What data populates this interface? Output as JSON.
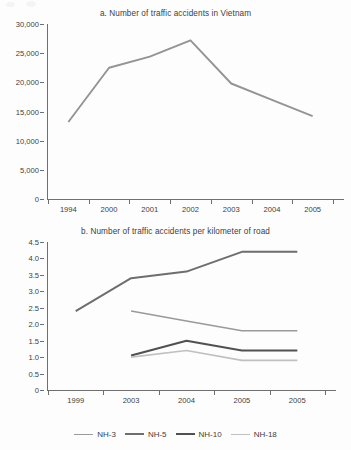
{
  "figure": {
    "background_color": "#fdfdfd",
    "axis_color": "#6f6f6f",
    "text_color": "#3d3d3d"
  },
  "chart_data": [
    {
      "type": "line",
      "panel": "a",
      "title": "a. Number of traffic accidents in Vietnam",
      "xlabel": "",
      "ylabel": "",
      "categories": [
        "1994",
        "2000",
        "2001",
        "2002",
        "2003",
        "2004",
        "2005"
      ],
      "ytick_labels": [
        "0",
        "5,000",
        "10,000",
        "15,000",
        "20,000",
        "25,000",
        "30,000"
      ],
      "ytick_values": [
        0,
        5000,
        10000,
        15000,
        20000,
        25000,
        30000
      ],
      "ylim": [
        0,
        30000
      ],
      "grid": false,
      "legend": "none",
      "series": [
        {
          "name": "Number of traffic accidents",
          "color": "#949494",
          "width": 1.9,
          "values": [
            13200,
            22500,
            24400,
            27200,
            19800,
            17000,
            14200
          ]
        }
      ]
    },
    {
      "type": "line",
      "panel": "b",
      "title": "b. Number of traffic accidents per kilometer of road",
      "xlabel": "",
      "ylabel": "",
      "categories": [
        "1999",
        "2003",
        "2004",
        "2005",
        "2005"
      ],
      "ytick_labels": [
        "0",
        "0.5",
        "1.0",
        "1.5",
        "2.0",
        "2.5",
        "3.0",
        "3.5",
        "4.0",
        "4.5"
      ],
      "ytick_values": [
        0,
        0.5,
        1.0,
        1.5,
        2.0,
        2.5,
        3.0,
        3.5,
        4.0,
        4.5
      ],
      "ylim": [
        0,
        4.5
      ],
      "grid": false,
      "legend": "bottom",
      "series": [
        {
          "name": "NH-3",
          "color": "#9a9a9a",
          "width": 1.6,
          "values": [
            null,
            2.4,
            2.1,
            1.8,
            1.8
          ]
        },
        {
          "name": "NH-5",
          "color": "#6e6e6e",
          "width": 2.0,
          "values": [
            2.4,
            3.4,
            3.6,
            4.2,
            4.2
          ]
        },
        {
          "name": "NH-10",
          "color": "#515151",
          "width": 2.0,
          "values": [
            null,
            1.05,
            1.5,
            1.2,
            1.2
          ]
        },
        {
          "name": "NH-18",
          "color": "#c0c0c0",
          "width": 1.6,
          "values": [
            null,
            1.0,
            1.2,
            0.9,
            0.9
          ]
        }
      ]
    }
  ]
}
